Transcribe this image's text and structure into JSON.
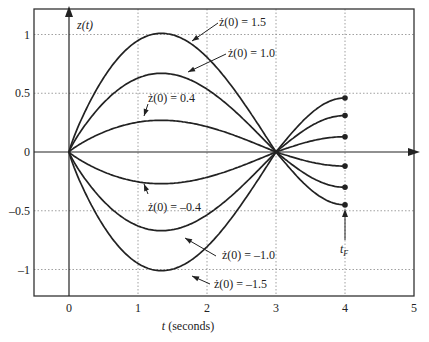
{
  "chart_data": {
    "type": "line",
    "title": "",
    "xlabel": "t (seconds)",
    "ylabel": "z(t)",
    "xlim": [
      -0.5,
      5
    ],
    "ylim": [
      -1.22,
      1.22
    ],
    "xticks": [
      0,
      1,
      2,
      3,
      4,
      5
    ],
    "xtick_labels": [
      "0",
      "1",
      "2",
      "3",
      "4",
      "5"
    ],
    "yticks": [
      1,
      0.5,
      0,
      -0.5,
      -1
    ],
    "ytick_labels": [
      "1",
      "0.5",
      "0",
      "–0.5",
      "–1"
    ],
    "grid": true,
    "colors": {
      "line": "#222222",
      "grid": "#888888",
      "frame": "#333333"
    },
    "series": [
      {
        "name": "ż(0) = 1.5",
        "zdot0": 1.5,
        "peak": 1.01,
        "end_value": 0.46
      },
      {
        "name": "ż(0) = 1.0",
        "zdot0": 1.0,
        "peak": 0.67,
        "end_value": 0.31
      },
      {
        "name": "ż(0) = 0.4",
        "zdot0": 0.4,
        "peak": 0.27,
        "end_value": 0.13
      },
      {
        "name": "ż(0) = –0.4",
        "zdot0": -0.4,
        "peak": -0.27,
        "end_value": -0.12
      },
      {
        "name": "ż(0) = –1.0",
        "zdot0": -1.0,
        "peak": -0.67,
        "end_value": -0.3
      },
      {
        "name": "ż(0) = –1.5",
        "zdot0": -1.5,
        "peak": -1.01,
        "end_value": -0.45
      }
    ],
    "curve_shape": {
      "zero_crossings_t": [
        0,
        3
      ],
      "peak_t": 1.25,
      "end_t": 4
    },
    "annotations": [
      {
        "text": "ż(0) = 1.5",
        "x": 219,
        "y": 26
      },
      {
        "text": "ż(0) = 1.0",
        "x": 228,
        "y": 57
      },
      {
        "text": "ż(0) = 0.4",
        "x": 148,
        "y": 102
      },
      {
        "text": "ż(0) = –0.4",
        "x": 148,
        "y": 211
      },
      {
        "text": "ż(0) = –1.0",
        "x": 222,
        "y": 259
      },
      {
        "text": "ż(0) = –1.5",
        "x": 214,
        "y": 288
      },
      {
        "text": "t_F",
        "x": 340,
        "y": 246
      }
    ]
  },
  "labels": {
    "z_axis": "z(t)",
    "t_axis": "t (seconds)",
    "tF_main": "t",
    "tF_sub": "F"
  }
}
